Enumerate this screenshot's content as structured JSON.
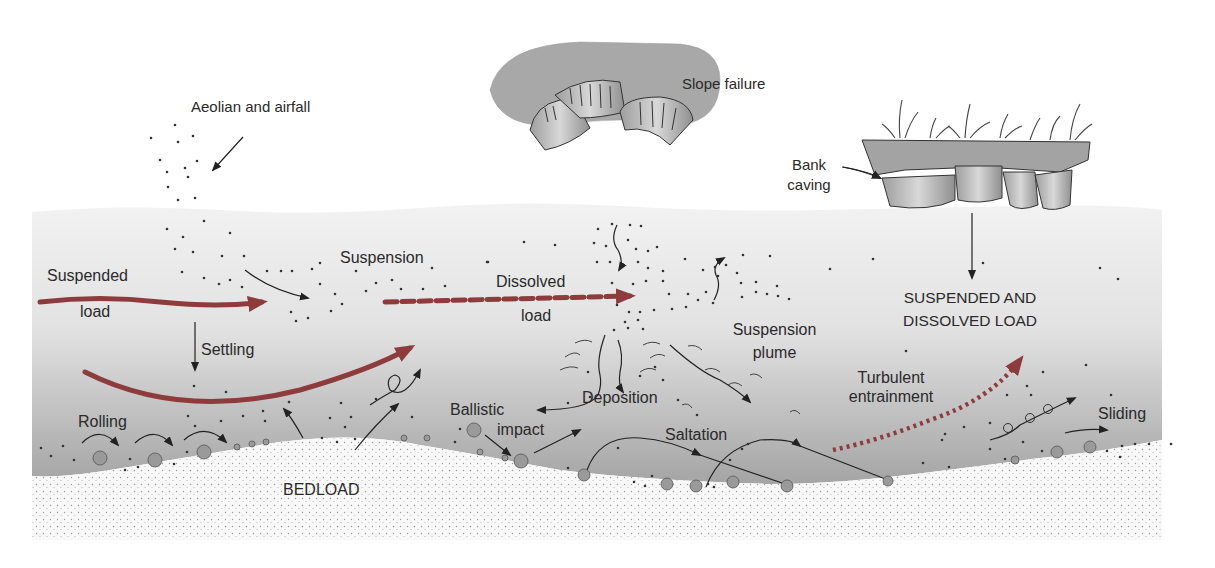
{
  "diagram": {
    "colors": {
      "water_top": "#f1f1f1",
      "water_bottom": "#a9a9a9",
      "bed": "#f7f7f7",
      "bed_stipple": "#9a9a9a",
      "bank": "#a6a6a6",
      "arrow_thick": "#8e3b3b",
      "arrow_thin": "#222222",
      "text": "#2a2a2a",
      "grain": "#9a9a9a"
    },
    "labels": {
      "aeolian": "Aeolian and airfall",
      "slope_failure": "Slope failure",
      "bank_caving_1": "Bank",
      "bank_caving_2": "caving",
      "suspended_1": "Suspended",
      "suspended_2": "load",
      "suspension": "Suspension",
      "dissolved_1": "Dissolved",
      "dissolved_2": "load",
      "settling": "Settling",
      "suspension_plume_1": "Suspension",
      "suspension_plume_2": "plume",
      "susp_diss_1": "SUSPENDED AND",
      "susp_diss_2": "DISSOLVED LOAD",
      "turbulent_1": "Turbulent",
      "turbulent_2": "entrainment",
      "rolling": "Rolling",
      "ballistic_1": "Ballistic",
      "ballistic_2": "impact",
      "deposition": "Deposition",
      "saltation": "Saltation",
      "sliding": "Sliding",
      "bedload": "BEDLOAD"
    }
  }
}
